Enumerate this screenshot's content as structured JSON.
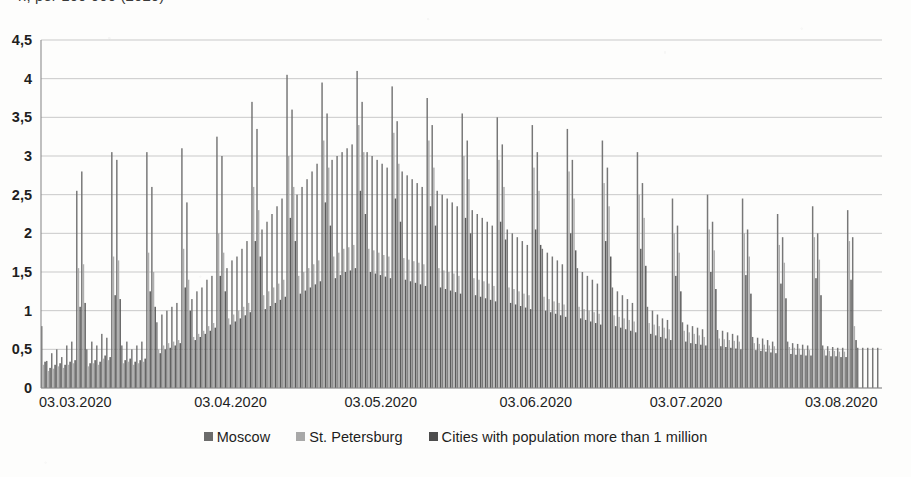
{
  "title_fragment": "n, per 100 000 (2020)",
  "axis": {
    "y_ticks": [
      "4,5",
      "4",
      "3,5",
      "3",
      "2,5",
      "2",
      "1,5",
      "1",
      "0,5",
      "0"
    ],
    "x_ticks": [
      "03.03.2020",
      "03.04.2020",
      "03.05.2020",
      "03.06.2020",
      "03.07.2020",
      "03.08.2020"
    ]
  },
  "legend": {
    "items": [
      {
        "label": "Moscow",
        "color": "#6b6b6b"
      },
      {
        "label": "St. Petersburg",
        "color": "#a8a8a8"
      },
      {
        "label": "Cities with population more than 1 million",
        "color": "#4d4d4d"
      }
    ]
  },
  "chart_data": {
    "type": "bar",
    "title": "n, per 100 000 (2020)",
    "xlabel": "",
    "ylabel": "",
    "ylim": [
      0,
      4.5
    ],
    "ytick_values": [
      0,
      0.5,
      1,
      1.5,
      2,
      2.5,
      3,
      3.5,
      4,
      4.5
    ],
    "ytick_labels": [
      "0",
      "0,5",
      "1",
      "1,5",
      "2",
      "2,5",
      "3",
      "3,5",
      "4",
      "4,5"
    ],
    "grid": true,
    "legend_position": "bottom",
    "decimal_separator": ",",
    "x_tick_labels": [
      "03.03.2020",
      "03.04.2020",
      "03.05.2020",
      "03.06.2020",
      "03.07.2020",
      "03.08.2020"
    ],
    "x_tick_dates": [
      "2020-03-03",
      "2020-04-03",
      "2020-05-03",
      "2020-06-03",
      "2020-07-03",
      "2020-08-03"
    ],
    "x_start_date": "2020-03-03",
    "x_end_date": "2020-08-17",
    "n_days": 168,
    "series": [
      {
        "name": "Moscow",
        "color": "#6b6b6b",
        "values": [
          0.8,
          0.35,
          0.45,
          0.5,
          0.4,
          0.55,
          0.6,
          2.55,
          2.8,
          0.5,
          0.6,
          0.55,
          0.7,
          0.65,
          3.05,
          2.95,
          0.55,
          0.6,
          0.5,
          0.55,
          0.6,
          3.05,
          2.6,
          0.85,
          0.95,
          1.0,
          1.05,
          1.1,
          3.1,
          2.4,
          1.15,
          1.25,
          1.3,
          1.4,
          1.45,
          3.25,
          3.0,
          1.55,
          1.65,
          1.7,
          1.8,
          1.9,
          3.7,
          3.35,
          2.05,
          2.15,
          2.25,
          2.35,
          2.45,
          4.05,
          3.6,
          2.5,
          2.6,
          2.7,
          2.8,
          2.9,
          3.95,
          3.55,
          2.95,
          3.0,
          3.05,
          3.1,
          3.15,
          4.1,
          3.7,
          3.05,
          3.0,
          2.95,
          2.9,
          2.85,
          3.9,
          3.45,
          2.8,
          2.75,
          2.7,
          2.65,
          2.6,
          3.75,
          3.4,
          2.55,
          2.5,
          2.45,
          2.4,
          2.35,
          3.55,
          3.2,
          2.3,
          2.25,
          2.2,
          2.15,
          2.1,
          3.5,
          3.15,
          2.05,
          2.0,
          1.95,
          1.9,
          1.85,
          3.4,
          3.05,
          1.8,
          1.75,
          1.7,
          1.65,
          1.6,
          3.35,
          2.95,
          1.55,
          1.5,
          1.45,
          1.4,
          1.35,
          3.2,
          2.85,
          1.3,
          1.25,
          1.2,
          1.15,
          1.1,
          3.05,
          2.65,
          1.05,
          1.0,
          0.95,
          0.9,
          0.88,
          2.45,
          2.1,
          0.85,
          0.82,
          0.8,
          0.78,
          0.76,
          2.5,
          2.15,
          0.75,
          0.74,
          0.72,
          0.7,
          0.68,
          2.45,
          2.05,
          0.66,
          0.65,
          0.64,
          0.62,
          0.6,
          2.25,
          1.95,
          0.6,
          0.58,
          0.57,
          0.56,
          0.55,
          2.35,
          2.0,
          0.55,
          0.54,
          0.53,
          0.52,
          0.52,
          2.3,
          1.95,
          0.52,
          0.52,
          0.52,
          0.52,
          0.52,
          2.35,
          0.95
        ]
      },
      {
        "name": "St. Petersburg",
        "color": "#a8a8a8",
        "values": [
          0.3,
          0.22,
          0.25,
          0.28,
          0.26,
          0.3,
          0.32,
          1.55,
          1.6,
          0.28,
          0.32,
          0.3,
          0.38,
          0.36,
          1.7,
          1.65,
          0.32,
          0.34,
          0.3,
          0.32,
          0.34,
          1.75,
          1.5,
          0.5,
          0.55,
          0.58,
          0.6,
          0.62,
          1.8,
          1.4,
          0.66,
          0.7,
          0.74,
          0.8,
          0.84,
          2.0,
          1.75,
          0.9,
          0.95,
          1.0,
          1.05,
          1.1,
          2.6,
          2.3,
          1.2,
          1.25,
          1.3,
          1.35,
          1.4,
          3.0,
          2.6,
          1.45,
          1.5,
          1.55,
          1.6,
          1.65,
          3.2,
          2.85,
          1.7,
          1.75,
          1.8,
          1.82,
          1.85,
          3.4,
          3.05,
          1.8,
          1.78,
          1.75,
          1.72,
          1.7,
          3.3,
          2.9,
          1.68,
          1.66,
          1.64,
          1.62,
          1.6,
          3.2,
          2.85,
          1.55,
          1.52,
          1.5,
          1.48,
          1.45,
          3.0,
          2.7,
          1.42,
          1.4,
          1.38,
          1.35,
          1.32,
          2.95,
          2.6,
          1.3,
          1.28,
          1.25,
          1.22,
          1.2,
          2.85,
          2.55,
          1.18,
          1.15,
          1.12,
          1.1,
          1.08,
          2.8,
          2.45,
          1.05,
          1.02,
          1.0,
          0.98,
          0.96,
          2.65,
          2.35,
          0.94,
          0.92,
          0.9,
          0.88,
          0.86,
          2.5,
          2.2,
          0.84,
          0.82,
          0.8,
          0.78,
          0.76,
          2.0,
          1.75,
          0.74,
          0.72,
          0.7,
          0.68,
          0.66,
          2.05,
          1.78,
          0.64,
          0.63,
          0.62,
          0.61,
          0.6,
          2.0,
          1.7,
          0.58,
          0.57,
          0.56,
          0.55,
          0.54,
          1.85,
          1.62,
          0.53,
          0.52,
          0.51,
          0.5,
          0.49,
          1.95,
          1.66,
          0.49,
          0.48,
          0.48,
          0.47,
          0.47,
          1.9,
          0.8
        ]
      },
      {
        "name": "Cities with population more than 1 million",
        "color": "#4d4d4d",
        "values": [
          0.34,
          0.26,
          0.3,
          0.32,
          0.3,
          0.34,
          0.36,
          1.05,
          1.1,
          0.32,
          0.36,
          0.34,
          0.42,
          0.4,
          1.2,
          1.15,
          0.36,
          0.38,
          0.34,
          0.36,
          0.38,
          1.25,
          1.05,
          0.45,
          0.5,
          0.52,
          0.55,
          0.58,
          1.3,
          1.0,
          0.62,
          0.66,
          0.7,
          0.74,
          0.78,
          1.45,
          1.25,
          0.82,
          0.86,
          0.9,
          0.94,
          0.98,
          1.9,
          1.7,
          1.02,
          1.06,
          1.1,
          1.14,
          1.18,
          2.2,
          1.9,
          1.22,
          1.26,
          1.3,
          1.34,
          1.38,
          2.4,
          2.1,
          1.42,
          1.46,
          1.5,
          1.52,
          1.55,
          2.55,
          2.25,
          1.5,
          1.48,
          1.46,
          1.44,
          1.42,
          2.45,
          2.15,
          1.4,
          1.38,
          1.36,
          1.34,
          1.32,
          2.35,
          2.1,
          1.3,
          1.28,
          1.26,
          1.24,
          1.22,
          2.2,
          2.0,
          1.2,
          1.18,
          1.16,
          1.14,
          1.12,
          2.15,
          1.92,
          1.1,
          1.08,
          1.06,
          1.04,
          1.02,
          2.05,
          1.85,
          1.0,
          0.98,
          0.96,
          0.94,
          0.92,
          2.0,
          1.78,
          0.9,
          0.88,
          0.86,
          0.84,
          0.82,
          1.9,
          1.7,
          0.8,
          0.78,
          0.76,
          0.74,
          0.72,
          1.8,
          1.58,
          0.7,
          0.68,
          0.66,
          0.64,
          0.62,
          1.45,
          1.25,
          0.6,
          0.58,
          0.57,
          0.56,
          0.55,
          1.5,
          1.28,
          0.54,
          0.53,
          0.52,
          0.51,
          0.5,
          1.46,
          1.22,
          0.49,
          0.48,
          0.47,
          0.46,
          0.45,
          1.35,
          1.16,
          0.44,
          0.43,
          0.43,
          0.42,
          0.42,
          1.42,
          1.2,
          0.42,
          0.41,
          0.41,
          0.4,
          0.4,
          1.4,
          0.62
        ]
      }
    ]
  }
}
